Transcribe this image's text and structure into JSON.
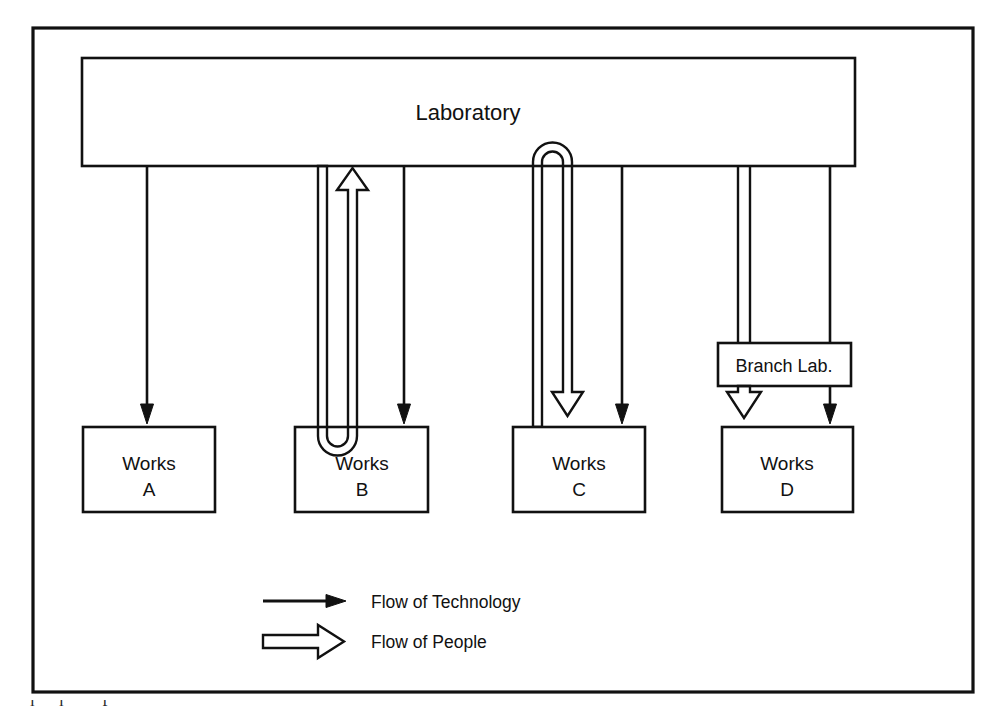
{
  "diagram": {
    "title_in_image": "",
    "outer_frame": {
      "name": "diagram-border"
    },
    "nodes": {
      "laboratory": {
        "label": "Laboratory"
      },
      "branch_lab": {
        "label": "Branch Lab."
      },
      "works_a": {
        "label_line1": "Works",
        "label_line2": "A"
      },
      "works_b": {
        "label_line1": "Works",
        "label_line2": "B"
      },
      "works_c": {
        "label_line1": "Works",
        "label_line2": "C"
      },
      "works_d": {
        "label_line1": "Works",
        "label_line2": "D"
      }
    },
    "legend": {
      "items": [
        {
          "key": "technology",
          "label": "Flow of Technology",
          "marker": "single-line-arrow"
        },
        {
          "key": "people",
          "label": "Flow of People",
          "marker": "double-line-arrow"
        }
      ]
    },
    "flows": [
      {
        "from": "Laboratory",
        "to": "Works A",
        "type": "technology",
        "direction": "down"
      },
      {
        "from": "Laboratory",
        "to": "Works B",
        "type": "technology",
        "direction": "down"
      },
      {
        "from": "Works B",
        "to": "Laboratory",
        "type": "people",
        "direction": "up"
      },
      {
        "from": "Laboratory",
        "to": "Works C",
        "type": "technology",
        "direction": "down"
      },
      {
        "from": "Laboratory",
        "to": "Works C",
        "type": "people",
        "direction": "down"
      },
      {
        "from": "Laboratory",
        "to": "Branch Lab.",
        "type": "people",
        "direction": "down"
      },
      {
        "from": "Laboratory",
        "to": "Works D",
        "type": "technology",
        "direction": "down"
      },
      {
        "from": "Branch Lab.",
        "to": "Works D",
        "type": "people",
        "direction": "down"
      }
    ]
  },
  "colors": {
    "stroke": "#111111",
    "background": "#ffffff",
    "text": "#111111"
  },
  "caption": {
    "partial_text": "below the frame"
  }
}
